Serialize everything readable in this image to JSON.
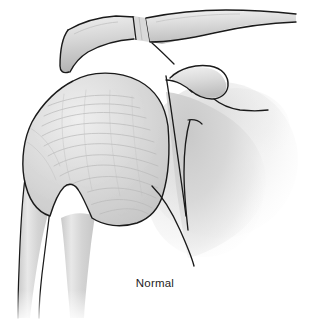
{
  "figure": {
    "caption": "Normal",
    "caption_x": 140,
    "caption_y": 277,
    "width": 310,
    "height": 323,
    "background_color": "#ffffff",
    "outline_color": "#1a1a1a",
    "bone_fill_light": "#e6e6e6",
    "bone_fill_mid": "#d2d2d2",
    "bone_fill_dark": "#b9b9b9",
    "soft_tissue_color": "#cfcfcf",
    "texture_line_color": "#b4b4b4",
    "caption_color": "#1d1d1d"
  },
  "structures": [
    {
      "id": "clavicle",
      "label": "Clavicle",
      "description": "Long bone sweeping from the acromioclavicular joint upward and to the right off the edge of the frame"
    },
    {
      "id": "ac-joint",
      "label": "Acromioclavicular joint",
      "description": "Narrow banded joint space between the distal clavicle and the acromion near the top of the image"
    },
    {
      "id": "acromion",
      "label": "Acromion",
      "description": "Broad flattened process of the scapula arching over the humeral head at the top left"
    },
    {
      "id": "humeral-head",
      "label": "Humeral head",
      "description": "Large rounded proximal humerus with fine trabecular striations filling the left half of the image"
    },
    {
      "id": "greater-tuberosity",
      "label": "Greater tuberosity",
      "description": "Lateral prominence on the left margin of the humeral head"
    },
    {
      "id": "bicipital-groove",
      "label": "Bicipital groove notch",
      "description": "Narrow V shaped notch between the humeral shaft and the head inferiorly"
    },
    {
      "id": "humeral-shaft",
      "label": "Humeral shaft",
      "description": "Vertical cortical shaft descending to the lower edge of the frame and fading out"
    },
    {
      "id": "coracoid-process",
      "label": "Coracoid process",
      "description": "Hook shaped process projecting to the right just below the clavicle"
    },
    {
      "id": "glenoid",
      "label": "Glenoid",
      "description": "Articular surface of the scapula seen end on as a pair of curved lines medial to the humeral head"
    },
    {
      "id": "scapular-body",
      "label": "Scapular body",
      "description": "Soft grey translucent body of the scapula on the right fading into the white background"
    },
    {
      "id": "scapular-neck",
      "label": "Scapular neck",
      "description": "Narrowed region of the scapula below the glenoid"
    },
    {
      "id": "lateral-border",
      "label": "Lateral scapular border",
      "description": "Long line running inferiorly from the glenoid toward the bottom right"
    }
  ]
}
